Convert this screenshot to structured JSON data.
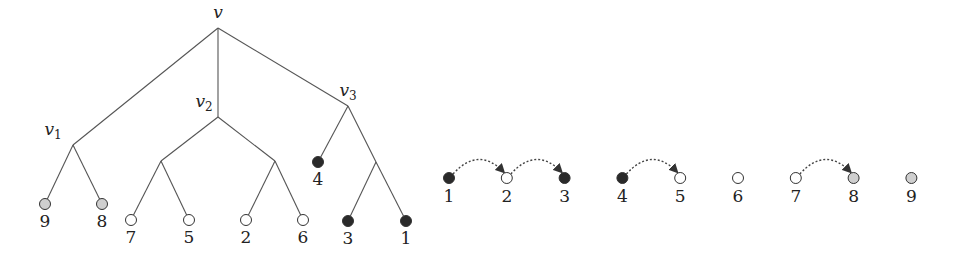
{
  "colors": {
    "black": "#2a2a2a",
    "white": "#ffffff",
    "gray": "#cfcfcf"
  },
  "tree": {
    "internal_nodes": [
      {
        "id": "v",
        "label": "v",
        "sub": ""
      },
      {
        "id": "v1",
        "label": "v",
        "sub": "1"
      },
      {
        "id": "v2",
        "label": "v",
        "sub": "2"
      },
      {
        "id": "v3",
        "label": "v",
        "sub": "3"
      },
      {
        "id": "v2a",
        "label": "",
        "sub": ""
      },
      {
        "id": "v2b",
        "label": "",
        "sub": ""
      },
      {
        "id": "v3a",
        "label": "",
        "sub": ""
      }
    ],
    "leaves": [
      {
        "id": "L9",
        "label": "9",
        "color": "gray"
      },
      {
        "id": "L8",
        "label": "8",
        "color": "gray"
      },
      {
        "id": "L7",
        "label": "7",
        "color": "white"
      },
      {
        "id": "L5",
        "label": "5",
        "color": "white"
      },
      {
        "id": "L2",
        "label": "2",
        "color": "white"
      },
      {
        "id": "L6",
        "label": "6",
        "color": "white"
      },
      {
        "id": "L4",
        "label": "4",
        "color": "black"
      },
      {
        "id": "L3",
        "label": "3",
        "color": "black"
      },
      {
        "id": "L1",
        "label": "1",
        "color": "black"
      }
    ],
    "edges": [
      [
        "v",
        "v1"
      ],
      [
        "v",
        "v2"
      ],
      [
        "v",
        "v3"
      ],
      [
        "v1",
        "L9"
      ],
      [
        "v1",
        "L8"
      ],
      [
        "v2",
        "v2a"
      ],
      [
        "v2",
        "v2b"
      ],
      [
        "v2a",
        "L7"
      ],
      [
        "v2a",
        "L5"
      ],
      [
        "v2b",
        "L2"
      ],
      [
        "v2b",
        "L6"
      ],
      [
        "v3",
        "L4"
      ],
      [
        "v3",
        "v3a"
      ],
      [
        "v3a",
        "L3"
      ],
      [
        "v3a",
        "L1"
      ]
    ]
  },
  "sequence": {
    "nodes": [
      {
        "label": "1",
        "color": "black"
      },
      {
        "label": "2",
        "color": "white"
      },
      {
        "label": "3",
        "color": "black"
      },
      {
        "label": "4",
        "color": "black"
      },
      {
        "label": "5",
        "color": "white"
      },
      {
        "label": "6",
        "color": "white"
      },
      {
        "label": "7",
        "color": "white"
      },
      {
        "label": "8",
        "color": "gray"
      },
      {
        "label": "9",
        "color": "gray"
      }
    ],
    "arrows": [
      [
        "1",
        "2"
      ],
      [
        "2",
        "3"
      ],
      [
        "4",
        "5"
      ],
      [
        "7",
        "8"
      ]
    ]
  }
}
